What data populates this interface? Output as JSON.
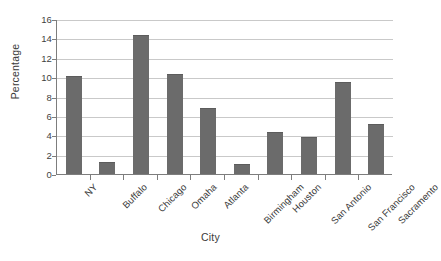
{
  "chart_data": {
    "type": "bar",
    "title": "",
    "xlabel": "City",
    "ylabel": "Percentage",
    "categories": [
      "NY",
      "Buffalo",
      "Chicago",
      "Omaha",
      "Atlanta",
      "Birmingham",
      "Houston",
      "San Antonio",
      "San Francisco",
      "Sacramento"
    ],
    "values": [
      10.1,
      1.2,
      14.4,
      10.3,
      6.8,
      1.0,
      4.3,
      3.8,
      9.5,
      5.2
    ],
    "ylim": [
      0,
      16
    ],
    "ytick_labels": [
      "16",
      "14",
      "12",
      "10",
      "8",
      "6",
      "4",
      "2",
      "0"
    ],
    "ytick_values": [
      16,
      14,
      12,
      10,
      8,
      6,
      4,
      2,
      0
    ],
    "ytick_step": 2,
    "grid": "horizontal",
    "legend": "none",
    "bar_color": "#6b6b6b",
    "gridline_color": "#c9c9c9",
    "axis_color": "#7d7d7d",
    "background_color": "#ffffff",
    "xtick_label_rotation": "-45"
  }
}
